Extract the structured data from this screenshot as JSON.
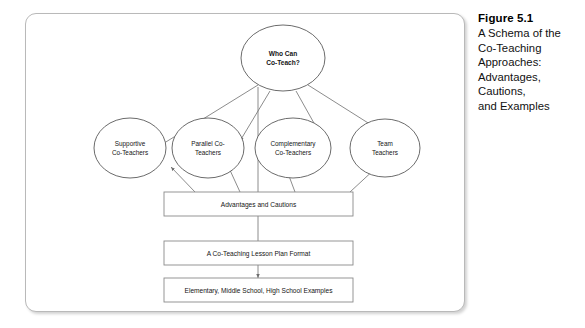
{
  "caption": {
    "title": "Figure 5.1",
    "lines": [
      "A Schema of the",
      "Co-Teaching",
      "Approaches:",
      "Advantages,",
      "Cautions,",
      "and Examples"
    ]
  },
  "diagram": {
    "root": {
      "id": "who-can-co-teach",
      "line1": "Who Can",
      "line2": "Co-Teach?"
    },
    "approaches": [
      {
        "id": "supportive-co-teachers",
        "line1": "Supportive",
        "line2": "Co-Teachers"
      },
      {
        "id": "parallel-co-teachers",
        "line1": "Parallel Co-",
        "line2": "Teachers"
      },
      {
        "id": "complementary-co-teachers",
        "line1": "Complementary",
        "line2": "Co-Teachers"
      },
      {
        "id": "team-teachers",
        "line1": "Team",
        "line2": "Teachers"
      }
    ],
    "boxes": [
      {
        "id": "advantages-and-cautions",
        "label": "Advantages and Cautions"
      },
      {
        "id": "lesson-plan-format",
        "label": "A Co-Teaching Lesson Plan Format"
      },
      {
        "id": "school-level-examples",
        "label": "Elementary, Middle School, High School Examples"
      }
    ]
  },
  "colors": {
    "frame_border": "#b9b9b9",
    "node_stroke": "#5a5a5a",
    "box_stroke": "#8a8a8a",
    "connector": "#6e6e6e",
    "text": "#151515",
    "background": "#ffffff"
  }
}
